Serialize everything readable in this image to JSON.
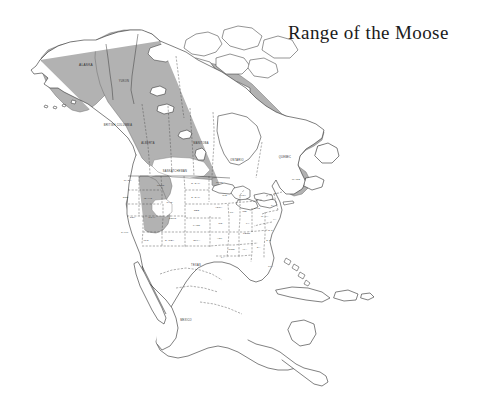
{
  "figure": {
    "title": "Range of the Moose",
    "type": "species-range-map",
    "region": "North America",
    "projection": "conic",
    "background_color": "#ffffff",
    "outline_color": "#2b2b2b"
  },
  "legend": {
    "range_fill_color": "#b2b2b2",
    "non_range_fill_color": "#ffffff",
    "range_description": "Shaded area indicates the geographic range of the moose",
    "shown_on_map": false
  },
  "range_summary": {
    "included_regions": [
      "Alaska",
      "Yukon",
      "Northwest Territories",
      "British Columbia",
      "Alberta",
      "Saskatchewan",
      "Manitoba",
      "Ontario",
      "Quebec",
      "Newfoundland",
      "Maritime Provinces",
      "Northern Rocky Mountains",
      "Northern Minnesota",
      "Northern Michigan",
      "Maine and Northern New England"
    ],
    "excluded_regions": [
      "Hudson Bay",
      "Canadian Arctic Archipelago",
      "Southern Prairies",
      "Central Wyoming basin",
      "Southern and Southwestern United States",
      "Mexico",
      "Central America",
      "Caribbean"
    ]
  },
  "labels": {
    "canada": [
      {
        "name": "ALASKA",
        "x": 86,
        "y": 66,
        "size": "big"
      },
      {
        "name": "YUKON",
        "x": 124,
        "y": 82,
        "size": "normal"
      },
      {
        "name": "BRITISH COLUMBIA",
        "x": 118,
        "y": 126,
        "size": "normal"
      },
      {
        "name": "ALBERTA",
        "x": 148,
        "y": 144,
        "size": "normal"
      },
      {
        "name": "MANITOBA",
        "x": 201,
        "y": 144,
        "size": "normal"
      },
      {
        "name": "SASKATCHEWAN",
        "x": 175,
        "y": 172,
        "size": "normal"
      },
      {
        "name": "ONTARIO",
        "x": 237,
        "y": 161,
        "size": "normal"
      },
      {
        "name": "QUEBEC",
        "x": 285,
        "y": 158,
        "size": "normal"
      }
    ],
    "united_states": [
      {
        "name": "WASH.",
        "x": 128,
        "y": 181,
        "size": "sm"
      },
      {
        "name": "MONT.",
        "x": 161,
        "y": 186,
        "size": "sm"
      },
      {
        "name": "N. DAK.",
        "x": 196,
        "y": 184,
        "size": "sm"
      },
      {
        "name": "MINN.",
        "x": 220,
        "y": 183,
        "size": "sm"
      },
      {
        "name": "ORE.",
        "x": 126,
        "y": 198,
        "size": "sm"
      },
      {
        "name": "IDAHO",
        "x": 148,
        "y": 199,
        "size": "sm"
      },
      {
        "name": "WYO.",
        "x": 170,
        "y": 203,
        "size": "sm"
      },
      {
        "name": "S. DAK.",
        "x": 196,
        "y": 198,
        "size": "sm"
      },
      {
        "name": "WIS.",
        "x": 225,
        "y": 196,
        "size": "sm"
      },
      {
        "name": "MICH.",
        "x": 243,
        "y": 196,
        "size": "sm"
      },
      {
        "name": "NEB.",
        "x": 197,
        "y": 211,
        "size": "sm"
      },
      {
        "name": "IOWA",
        "x": 219,
        "y": 208,
        "size": "sm"
      },
      {
        "name": "NEV.",
        "x": 133,
        "y": 218,
        "size": "sm"
      },
      {
        "name": "UTAH",
        "x": 152,
        "y": 218,
        "size": "sm"
      },
      {
        "name": "COLO.",
        "x": 173,
        "y": 219,
        "size": "sm"
      },
      {
        "name": "ILL.",
        "x": 232,
        "y": 213,
        "size": "sm"
      },
      {
        "name": "IND.",
        "x": 245,
        "y": 212,
        "size": "sm"
      },
      {
        "name": "OHIO",
        "x": 257,
        "y": 209,
        "size": "sm"
      },
      {
        "name": "PA.",
        "x": 273,
        "y": 206,
        "size": "sm"
      },
      {
        "name": "N.Y.",
        "x": 277,
        "y": 194,
        "size": "sm"
      },
      {
        "name": "KANS.",
        "x": 197,
        "y": 226,
        "size": "sm"
      },
      {
        "name": "MO.",
        "x": 221,
        "y": 224,
        "size": "sm"
      },
      {
        "name": "KY.",
        "x": 248,
        "y": 224,
        "size": "sm"
      },
      {
        "name": "W. VA.",
        "x": 265,
        "y": 217,
        "size": "sm"
      },
      {
        "name": "VA.",
        "x": 275,
        "y": 220,
        "size": "sm"
      },
      {
        "name": "CALIF.",
        "x": 125,
        "y": 233,
        "size": "sm"
      },
      {
        "name": "ARIZ.",
        "x": 146,
        "y": 241,
        "size": "sm"
      },
      {
        "name": "N. MEX.",
        "x": 170,
        "y": 241,
        "size": "sm"
      },
      {
        "name": "OKLA.",
        "x": 197,
        "y": 241,
        "size": "sm"
      },
      {
        "name": "ARK.",
        "x": 220,
        "y": 239,
        "size": "sm"
      },
      {
        "name": "TENN.",
        "x": 247,
        "y": 234,
        "size": "sm"
      },
      {
        "name": "N.C.",
        "x": 271,
        "y": 231,
        "size": "sm"
      },
      {
        "name": "S.C.",
        "x": 269,
        "y": 241,
        "size": "sm"
      },
      {
        "name": "MISS.",
        "x": 232,
        "y": 250,
        "size": "sm"
      },
      {
        "name": "ALA.",
        "x": 245,
        "y": 250,
        "size": "sm"
      },
      {
        "name": "GA.",
        "x": 259,
        "y": 248,
        "size": "sm"
      },
      {
        "name": "LA.",
        "x": 223,
        "y": 258,
        "size": "sm"
      },
      {
        "name": "TEXAS",
        "x": 196,
        "y": 266,
        "size": "normal"
      },
      {
        "name": "FLA.",
        "x": 271,
        "y": 267,
        "size": "sm"
      },
      {
        "name": "MAINE",
        "x": 296,
        "y": 180,
        "size": "sm"
      }
    ],
    "other": [
      {
        "name": "MEXICO",
        "x": 186,
        "y": 321,
        "size": "normal"
      }
    ]
  }
}
